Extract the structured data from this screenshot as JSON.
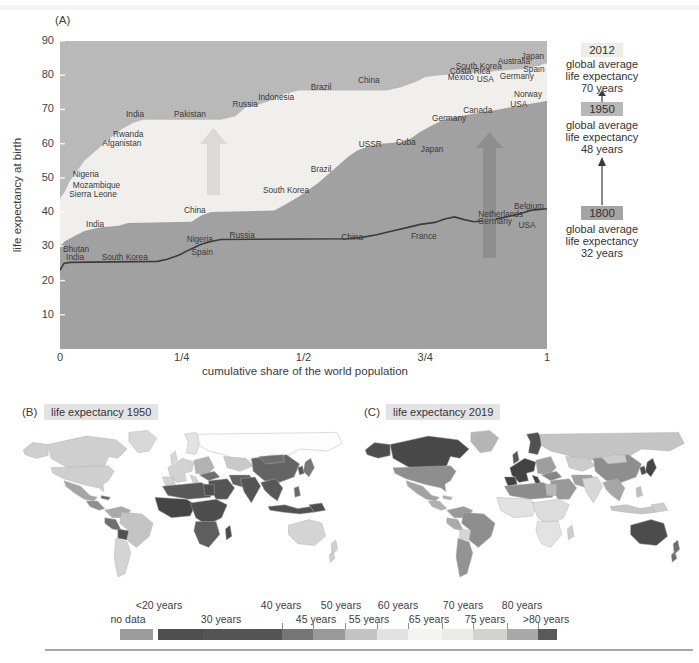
{
  "panel_a": {
    "label": "(A)",
    "y_axis_title": "life expectancy at birth",
    "x_axis_title": "cumulative share of the world population",
    "y_ticks": [
      90,
      80,
      70,
      60,
      50,
      40,
      30,
      20,
      10
    ],
    "x_ticks": [
      {
        "label": "0",
        "v": 0
      },
      {
        "label": "1/4",
        "v": 0.25
      },
      {
        "label": "1/2",
        "v": 0.5
      },
      {
        "label": "3/4",
        "v": 0.75
      },
      {
        "label": "1",
        "v": 1
      }
    ],
    "annotations": [
      {
        "year": "2012",
        "lines": "global average\nlife expectancy\n70 years"
      },
      {
        "year": "1950",
        "lines": "global average\nlife expectancy\n48 years"
      },
      {
        "year": "1800",
        "lines": "global average\nlife expectancy\n32 years"
      }
    ]
  },
  "chart_data": {
    "type": "area",
    "xlabel": "cumulative share of the world population",
    "ylabel": "life expectancy at birth",
    "xlim": [
      0,
      1
    ],
    "ylim": [
      0,
      90
    ],
    "series": [
      {
        "name": "2012",
        "style": "area",
        "points": [
          [
            0,
            44
          ],
          [
            0.01,
            46
          ],
          [
            0.02,
            49
          ],
          [
            0.035,
            52
          ],
          [
            0.05,
            55
          ],
          [
            0.07,
            57.5
          ],
          [
            0.09,
            60
          ],
          [
            0.11,
            62.5
          ],
          [
            0.13,
            64.5
          ],
          [
            0.15,
            66
          ],
          [
            0.17,
            67
          ],
          [
            0.33,
            67
          ],
          [
            0.36,
            68
          ],
          [
            0.38,
            70.5
          ],
          [
            0.41,
            71.5
          ],
          [
            0.44,
            73
          ],
          [
            0.46,
            74.5
          ],
          [
            0.49,
            75.5
          ],
          [
            0.67,
            75.5
          ],
          [
            0.7,
            76.5
          ],
          [
            0.73,
            78
          ],
          [
            0.75,
            79.5
          ],
          [
            0.78,
            80
          ],
          [
            0.83,
            80.5
          ],
          [
            0.88,
            81
          ],
          [
            0.92,
            81.5
          ],
          [
            0.96,
            82
          ],
          [
            1,
            83.5
          ]
        ],
        "labels": [
          {
            "t": "Nigeria",
            "x": 0.053,
            "y": 51.1
          },
          {
            "t": "Mozambique",
            "x": 0.075,
            "y": 47.9
          },
          {
            "t": "Sierra Leone",
            "x": 0.068,
            "y": 45.4
          },
          {
            "t": "Afganistan",
            "x": 0.127,
            "y": 60.2
          },
          {
            "t": "Rwanda",
            "x": 0.14,
            "y": 62.8
          },
          {
            "t": "India",
            "x": 0.154,
            "y": 68.7
          },
          {
            "t": "Pakistan",
            "x": 0.267,
            "y": 68.7
          },
          {
            "t": "Russia",
            "x": 0.38,
            "y": 71.6
          },
          {
            "t": "Indonesia",
            "x": 0.444,
            "y": 73.6
          },
          {
            "t": "Brazil",
            "x": 0.536,
            "y": 76.6
          },
          {
            "t": "China",
            "x": 0.634,
            "y": 78.6
          },
          {
            "t": "Mexico",
            "x": 0.823,
            "y": 79.5
          },
          {
            "t": "Costa Rica",
            "x": 0.842,
            "y": 81.2
          },
          {
            "t": "South Korea",
            "x": 0.86,
            "y": 82.7
          },
          {
            "t": "USA",
            "x": 0.873,
            "y": 78.9
          },
          {
            "t": "Australia",
            "x": 0.932,
            "y": 84.2
          },
          {
            "t": "Germany",
            "x": 0.938,
            "y": 79.8
          },
          {
            "t": "Spain",
            "x": 0.973,
            "y": 81.8
          },
          {
            "t": "Japan",
            "x": 0.971,
            "y": 85.6
          }
        ]
      },
      {
        "name": "1950",
        "style": "area",
        "points": [
          [
            0,
            30
          ],
          [
            0.01,
            31.5
          ],
          [
            0.03,
            33
          ],
          [
            0.05,
            34.5
          ],
          [
            0.08,
            35.5
          ],
          [
            0.12,
            36
          ],
          [
            0.14,
            36.8
          ],
          [
            0.27,
            37.2
          ],
          [
            0.29,
            39
          ],
          [
            0.31,
            40
          ],
          [
            0.44,
            40.5
          ],
          [
            0.46,
            42
          ],
          [
            0.49,
            44.5
          ],
          [
            0.51,
            46.5
          ],
          [
            0.53,
            48.5
          ],
          [
            0.55,
            51
          ],
          [
            0.57,
            53.5
          ],
          [
            0.59,
            56
          ],
          [
            0.61,
            58
          ],
          [
            0.63,
            59
          ],
          [
            0.66,
            60
          ],
          [
            0.7,
            60.5
          ],
          [
            0.72,
            61.5
          ],
          [
            0.74,
            63.5
          ],
          [
            0.76,
            65
          ],
          [
            0.78,
            66.5
          ],
          [
            0.8,
            67.5
          ],
          [
            0.84,
            68.5
          ],
          [
            0.88,
            69.5
          ],
          [
            0.92,
            70.5
          ],
          [
            0.96,
            71.5
          ],
          [
            1,
            72.5
          ]
        ],
        "labels": [
          {
            "t": "India",
            "x": 0.072,
            "y": 36.5
          },
          {
            "t": "China",
            "x": 0.277,
            "y": 40.6
          },
          {
            "t": "South Korea",
            "x": 0.464,
            "y": 46.5
          },
          {
            "t": "Brazil",
            "x": 0.536,
            "y": 52.6
          },
          {
            "t": "USSR",
            "x": 0.637,
            "y": 59.9
          },
          {
            "t": "Cuba",
            "x": 0.71,
            "y": 60.5
          },
          {
            "t": "Japan",
            "x": 0.764,
            "y": 58.4
          },
          {
            "t": "Germany",
            "x": 0.799,
            "y": 67.5
          },
          {
            "t": "Canada",
            "x": 0.858,
            "y": 69.9
          },
          {
            "t": "USA",
            "x": 0.942,
            "y": 71.6
          },
          {
            "t": "Norway",
            "x": 0.961,
            "y": 74.5
          }
        ]
      },
      {
        "name": "1800",
        "style": "line",
        "points": [
          [
            0,
            23
          ],
          [
            0.008,
            25
          ],
          [
            0.02,
            25.3
          ],
          [
            0.2,
            25.6
          ],
          [
            0.22,
            26.2
          ],
          [
            0.245,
            27.5
          ],
          [
            0.26,
            28.6
          ],
          [
            0.275,
            29.6
          ],
          [
            0.29,
            30.6
          ],
          [
            0.31,
            31.4
          ],
          [
            0.33,
            32
          ],
          [
            0.59,
            32.2
          ],
          [
            0.62,
            32.6
          ],
          [
            0.65,
            33.4
          ],
          [
            0.68,
            34.4
          ],
          [
            0.71,
            35.4
          ],
          [
            0.74,
            36.4
          ],
          [
            0.77,
            37
          ],
          [
            0.79,
            38
          ],
          [
            0.81,
            38.6
          ],
          [
            0.83,
            37.8
          ],
          [
            0.85,
            37.2
          ],
          [
            0.88,
            37.6
          ],
          [
            0.91,
            38.4
          ],
          [
            0.94,
            39.4
          ],
          [
            0.97,
            40.6
          ],
          [
            1,
            41
          ]
        ],
        "labels": [
          {
            "t": "Bhutan",
            "x": 0.033,
            "y": 29.2
          },
          {
            "t": "India",
            "x": 0.031,
            "y": 26.9
          },
          {
            "t": "South Korea",
            "x": 0.133,
            "y": 26.9
          },
          {
            "t": "Nigeria",
            "x": 0.287,
            "y": 32.1
          },
          {
            "t": "Spain",
            "x": 0.292,
            "y": 28.3
          },
          {
            "t": "Russia",
            "x": 0.374,
            "y": 33.3
          },
          {
            "t": "China",
            "x": 0.6,
            "y": 32.7
          },
          {
            "t": "France",
            "x": 0.747,
            "y": 33
          },
          {
            "t": "Germany",
            "x": 0.893,
            "y": 37.4
          },
          {
            "t": "Netherlands",
            "x": 0.905,
            "y": 39.4
          },
          {
            "t": "Belgium",
            "x": 0.963,
            "y": 41.8
          },
          {
            "t": "USA",
            "x": 0.959,
            "y": 36.2
          }
        ]
      }
    ],
    "legend_bins": [
      {
        "label": "<20 years",
        "color": "#4f4f4f"
      },
      {
        "label": "30 years",
        "color": "#545454"
      },
      {
        "label": "40 years",
        "color": "#757575"
      },
      {
        "label": "45 years",
        "color": "#9a9a9a"
      },
      {
        "label": "50 years",
        "color": "#c3c3c3"
      },
      {
        "label": "55 years",
        "color": "#e2e2e2"
      },
      {
        "label": "60 years",
        "color": "#f4f4f1"
      },
      {
        "label": "65 years",
        "color": "#eaeae6"
      },
      {
        "label": "70 years",
        "color": "#d2d2cf"
      },
      {
        "label": "75 years",
        "color": "#a8a8a8"
      },
      {
        "label": "80 years",
        "color": "#595959"
      },
      {
        "label": "no data",
        "color": "#9c9c9c"
      }
    ]
  },
  "panel_b": {
    "label": "(B)",
    "title": "life expectancy 1950"
  },
  "panel_c": {
    "label": "(C)",
    "title": "life expectancy 2019"
  },
  "maps": {
    "regions": [
      {
        "id": "alaska",
        "f1950": "#cfcfcf",
        "f2019": "#4e4e4e"
      },
      {
        "id": "canada",
        "f1950": "#cfcfcf",
        "f2019": "#484848"
      },
      {
        "id": "greenland",
        "f1950": "#d8d8d8",
        "f2019": "#b5b5b5"
      },
      {
        "id": "usa",
        "f1950": "#cfcfcf",
        "f2019": "#8e8e8e"
      },
      {
        "id": "mexico",
        "f1950": "#a5a5a5",
        "f2019": "#a2a2a2"
      },
      {
        "id": "central-america",
        "f1950": "#8f8f8f",
        "f2019": "#b0b0b0"
      },
      {
        "id": "caribbean",
        "f1950": "#6a6a6a",
        "f2019": "#b0b0b0"
      },
      {
        "id": "colombia-venezuela",
        "f1950": "#a9a9a9",
        "f2019": "#9a9a9a"
      },
      {
        "id": "peru",
        "f1950": "#6f6f6f",
        "f2019": "#ababab"
      },
      {
        "id": "bolivia",
        "f1950": "#525252",
        "f2019": "#d6d6d6"
      },
      {
        "id": "brazil",
        "f1950": "#c4c4c4",
        "f2019": "#8e8e8e"
      },
      {
        "id": "southern-cone",
        "f1950": "#d4d4d4",
        "f2019": "#939393"
      },
      {
        "id": "uk",
        "f1950": "#d6d6d6",
        "f2019": "#565656"
      },
      {
        "id": "scandinavia",
        "f1950": "#e3e3e3",
        "f2019": "#515151"
      },
      {
        "id": "europe-west",
        "f1950": "#d2d2d2",
        "f2019": "#424242"
      },
      {
        "id": "europe-east",
        "f1950": "#b2b2b2",
        "f2019": "#9e9e9e"
      },
      {
        "id": "russia",
        "f1950": "#fdfdfd",
        "f2019": "#c4c4c4"
      },
      {
        "id": "kazakhstan",
        "f1950": "#c9c9c9",
        "f2019": "#cccccc"
      },
      {
        "id": "turkey",
        "f1950": "#6e6e6e",
        "f2019": "#868686"
      },
      {
        "id": "middle-east",
        "f1950": "#555555",
        "f2019": "#999999"
      },
      {
        "id": "iran",
        "f1950": "#606060",
        "f2019": "#a0a0a0"
      },
      {
        "id": "north-africa",
        "f1950": "#585858",
        "f2019": "#8c8c8c"
      },
      {
        "id": "egypt",
        "f1950": "#4f4f4f",
        "f2019": "#b8b8b8"
      },
      {
        "id": "west-africa",
        "f1950": "#454545",
        "f2019": "#e2e2e2"
      },
      {
        "id": "east-africa",
        "f1950": "#4e4e4e",
        "f2019": "#dcdcdc"
      },
      {
        "id": "southern-africa",
        "f1950": "#5e5e5e",
        "f2019": "#e3e3e3"
      },
      {
        "id": "madagascar",
        "f1950": "#4a4a4a",
        "f2019": "#cccccc"
      },
      {
        "id": "india",
        "f1950": "#555555",
        "f2019": "#d8d8d8"
      },
      {
        "id": "china",
        "f1950": "#646464",
        "f2019": "#8e8e8e"
      },
      {
        "id": "mongolia",
        "f1950": "#6e6e6e",
        "f2019": "#cccccc"
      },
      {
        "id": "se-asia",
        "f1950": "#585858",
        "f2019": "#a6a6a6"
      },
      {
        "id": "indonesia",
        "f1950": "#525252",
        "f2019": "#c6c6c6"
      },
      {
        "id": "philippines",
        "f1950": "#6a6a6a",
        "f2019": "#c0c0c0"
      },
      {
        "id": "japan",
        "f1950": "#767676",
        "f2019": "#454545"
      },
      {
        "id": "korea",
        "f1950": "#585858",
        "f2019": "#4a4a4a"
      },
      {
        "id": "papua",
        "f1950": "#4f4f4f",
        "f2019": "#cccccc"
      },
      {
        "id": "australia",
        "f1950": "#d4d4d4",
        "f2019": "#4c4c4c"
      },
      {
        "id": "new-zealand",
        "f1950": "#d0d0d0",
        "f2019": "#6e6e6e"
      }
    ]
  },
  "legend": {
    "top_labels": [
      {
        "text": "<20 years",
        "x": 159
      },
      {
        "text": "40 years",
        "x": 281
      },
      {
        "text": "50 years",
        "x": 341
      },
      {
        "text": "60 years",
        "x": 398
      },
      {
        "text": "70 years",
        "x": 463
      },
      {
        "text": "80 years",
        "x": 522
      }
    ],
    "bottom_labels": [
      {
        "text": "no data",
        "x": 128
      },
      {
        "text": "30 years",
        "x": 221
      },
      {
        "text": "45 years",
        "x": 316
      },
      {
        "text": "55 years",
        "x": 369
      },
      {
        "text": "65 years",
        "x": 429
      },
      {
        "text": "75 years",
        "x": 485
      },
      {
        "text": ">80 years",
        "x": 546
      }
    ],
    "no_data_swatch": {
      "from": 120,
      "to": 153,
      "color": "#9c9c9c"
    },
    "segments": [
      {
        "from": 158,
        "to": 203,
        "color": "#4f4f4f"
      },
      {
        "from": 203,
        "to": 282,
        "color": "#545454"
      },
      {
        "from": 282,
        "to": 313,
        "color": "#757575"
      },
      {
        "from": 313,
        "to": 345,
        "color": "#9a9a9a"
      },
      {
        "from": 345,
        "to": 377,
        "color": "#c3c3c3"
      },
      {
        "from": 377,
        "to": 408,
        "color": "#e2e2e2"
      },
      {
        "from": 408,
        "to": 442,
        "color": "#f4f4f1"
      },
      {
        "from": 442,
        "to": 473,
        "color": "#eaeae6"
      },
      {
        "from": 473,
        "to": 507,
        "color": "#d2d2cf"
      },
      {
        "from": 507,
        "to": 538,
        "color": "#a8a8a8"
      },
      {
        "from": 538,
        "to": 557,
        "color": "#595959"
      }
    ],
    "tick_positions": [
      282,
      313,
      345,
      377,
      408,
      442,
      473,
      507,
      538
    ]
  },
  "colors": {
    "area_above_2012": "#b9b9b9",
    "area_1950_to_2012": "#f0efeb",
    "area_below_1950": "#a1a1a1",
    "line_1800": "#3c3c3c",
    "arrow_light": "#dbdad6",
    "arrow_dark": "#8e8e8e",
    "box_2012": "#edece7",
    "box_1950": "#b7b7b7",
    "box_1800": "#a4a4a4",
    "panel_badge_bg": "#e3e3e3",
    "map_border": "#b0b0b0",
    "label_text": "#3a3a3a"
  }
}
